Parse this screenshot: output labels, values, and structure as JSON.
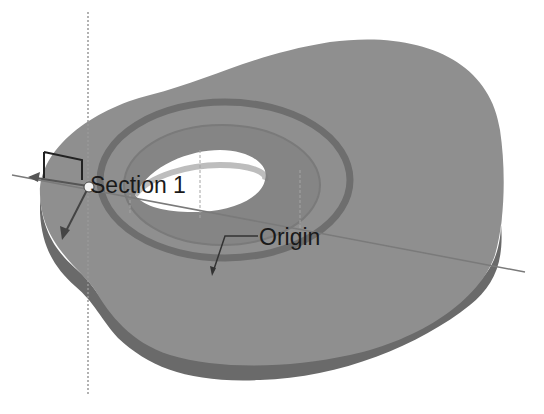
{
  "viewport": {
    "background": "#ffffff",
    "part_color": "#8f8f8f",
    "part_side_color": "#6a6a6a",
    "hole_color": "#ffffff",
    "axis_color": "#8a8a8a"
  },
  "annotations": {
    "section_label": "Section 1",
    "origin_label": "Origin"
  }
}
